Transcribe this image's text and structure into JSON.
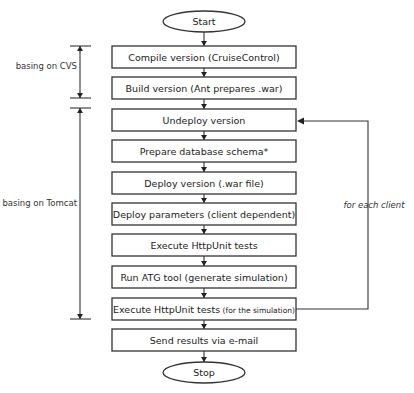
{
  "diagram": {
    "type": "flowchart",
    "start": "Start",
    "stop": "Stop",
    "steps": [
      {
        "id": "compile",
        "label": "Compile version (CruiseControl)",
        "note": ""
      },
      {
        "id": "build",
        "label": "Build version (Ant prepares .war)",
        "note": ""
      },
      {
        "id": "undeploy",
        "label": "Undeploy version",
        "note": ""
      },
      {
        "id": "prepare-db",
        "label": "Prepare database schema*",
        "note": ""
      },
      {
        "id": "deploy-version",
        "label": "Deploy version (.war file)",
        "note": ""
      },
      {
        "id": "deploy-params",
        "label": "Deploy parameters (client dependent)",
        "note": ""
      },
      {
        "id": "execute-tests",
        "label": "Execute HttpUnit tests",
        "note": ""
      },
      {
        "id": "run-atg",
        "label": "Run ATG tool (generate simulation)",
        "note": ""
      },
      {
        "id": "execute-sim-tests",
        "label": "Execute HttpUnit tests",
        "note": "(for the simulation)"
      },
      {
        "id": "send-results",
        "label": "Send results via e-mail",
        "note": ""
      }
    ],
    "brackets": [
      {
        "label": "basing on CVS",
        "from_step": 0,
        "to_step": 1
      },
      {
        "label": "basing on Tomcat",
        "from_step": 2,
        "to_step": 8
      }
    ],
    "loop": {
      "label": "for each client",
      "from_step": 8,
      "to_step": 2
    }
  }
}
